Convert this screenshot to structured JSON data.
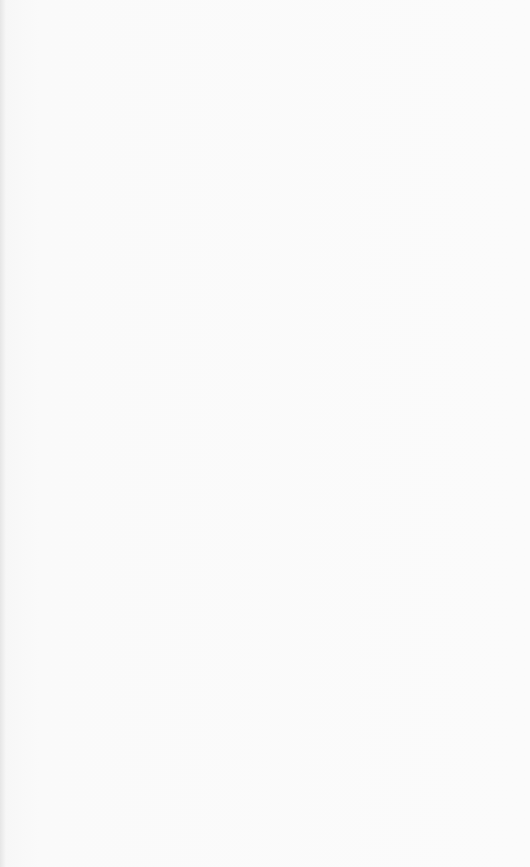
{
  "paper": {
    "kind": "lined notebook paper",
    "line_count": 27,
    "line_color": "#7a7a7a",
    "background_color": "#fafafa"
  }
}
